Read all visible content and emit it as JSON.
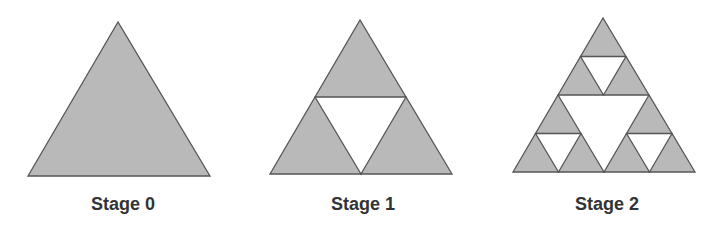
{
  "colors": {
    "fill": "#b9b9b9",
    "stroke": "#555555",
    "hole": "#ffffff",
    "label": "#333333"
  },
  "stages": [
    {
      "label": "Stage 0",
      "depth": 0,
      "apex": [
        118,
        22
      ],
      "left": [
        28,
        176
      ],
      "right": [
        210,
        176
      ],
      "label_center_x": 123
    },
    {
      "label": "Stage 1",
      "depth": 1,
      "apex": [
        360,
        20
      ],
      "left": [
        270,
        174
      ],
      "right": [
        452,
        174
      ],
      "label_center_x": 363
    },
    {
      "label": "Stage 2",
      "depth": 2,
      "apex": [
        603,
        18
      ],
      "left": [
        513,
        172
      ],
      "right": [
        695,
        172
      ],
      "label_center_x": 607
    }
  ]
}
